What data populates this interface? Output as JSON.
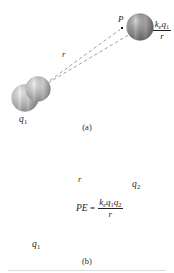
{
  "figure": {
    "background_color": "#ffffff",
    "line_color": "#9a9a9a",
    "text_color": "#262626"
  },
  "panels": [
    {
      "id": "a",
      "caption": "(a)",
      "spheres": [
        {
          "name": "q1",
          "label": "q",
          "subscript": "1",
          "cx": 25,
          "cy": 98,
          "r": 13.5,
          "color_light": "#e2e2e2",
          "color_mid": "#b6b6b6",
          "color_dark": "#8e8e8e"
        }
      ],
      "point": {
        "label": "P",
        "x": 122,
        "y": 28
      },
      "distance_label": "r",
      "equation": {
        "lhs": "V",
        "lhs_sub": "1",
        "relation": "=",
        "numerator_k": "k",
        "numerator_k_sub": "e",
        "numerator_q": "q",
        "numerator_q_sub": "1",
        "denominator": "r"
      }
    },
    {
      "id": "b",
      "caption": "(b)",
      "spheres": [
        {
          "name": "q2",
          "label": "q",
          "subscript": "2",
          "cx": 140,
          "cy": 163,
          "r": 13.5,
          "color_light": "#b9b9b9",
          "color_mid": "#8b8b8b",
          "color_dark": "#636363"
        },
        {
          "name": "q1",
          "label": "q",
          "subscript": "1",
          "cx": 38,
          "cy": 225,
          "r": 12.5,
          "color_light": "#dcdcdc",
          "color_mid": "#b2b2b2",
          "color_dark": "#8a8a8a"
        }
      ],
      "distance_label": "r",
      "equation": {
        "lhs": "PE",
        "relation": "=",
        "numerator_k": "k",
        "numerator_k_sub": "e",
        "numerator_q1": "q",
        "numerator_q1_sub": "1",
        "numerator_q2": "q",
        "numerator_q2_sub": "2",
        "denominator": "r"
      }
    }
  ]
}
